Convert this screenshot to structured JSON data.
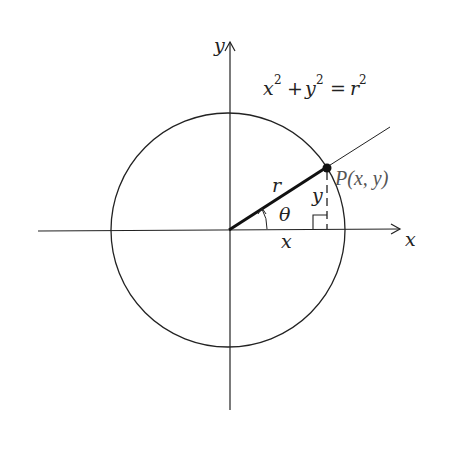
{
  "diagram": {
    "type": "unit-circle-polar-coordinates",
    "labels": {
      "y_axis": "y",
      "x_axis": "x",
      "equation_x": "x",
      "equation_y": "y",
      "equation_exp": "2",
      "equation_plus": "+",
      "equation_eq": "=",
      "equation_r": "r",
      "radius": "r",
      "angle": "θ",
      "leg_x": "x",
      "leg_y": "y",
      "point": "P(x, y)"
    },
    "colors": {
      "stroke": "#222222",
      "point_label": "#555555",
      "background": "#ffffff"
    }
  }
}
